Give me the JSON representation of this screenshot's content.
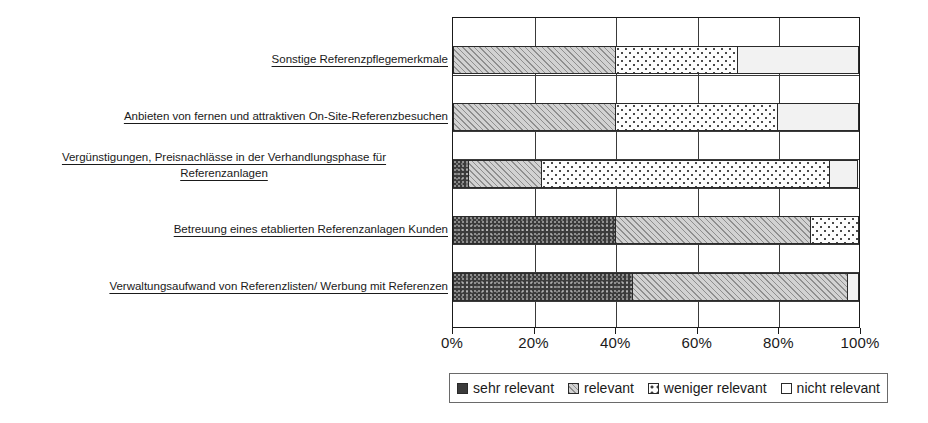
{
  "chart_data": {
    "type": "bar",
    "orientation": "horizontal",
    "stacked": true,
    "stack_mode": "percent",
    "title": "",
    "xlabel": "",
    "ylabel": "",
    "xlim": [
      0,
      100
    ],
    "xticks": [
      "0%",
      "20%",
      "40%",
      "60%",
      "80%",
      "100%"
    ],
    "xtick_values": [
      0,
      20,
      40,
      60,
      80,
      100
    ],
    "grid": true,
    "legend_position": "bottom",
    "categories": [
      "Verwaltungsaufwand von Referenzlisten/ Werbung mit Referenzen",
      "Betreuung eines etablierten Referenzanlagen Kunden",
      "Vergünstigungen, Preisnachlässe in der Verhandlungsphase für Referenzanlagen",
      "Anbieten von fernen und attraktiven On-Site-Referenzbesuchen",
      "Sonstige Referenzpflegemerkmale"
    ],
    "category_lines": [
      [
        "Verwaltungsaufwand von Referenzlisten/ Werbung mit Referenzen"
      ],
      [
        "Betreuung eines etablierten Referenzanlagen Kunden"
      ],
      [
        "Vergünstigungen, Preisnachlässe in der Verhandlungsphase für",
        "Referenzanlagen"
      ],
      [
        "Anbieten von fernen und attraktiven On-Site-Referenzbesuchen"
      ],
      [
        "Sonstige Referenzpflegemerkmale"
      ]
    ],
    "series": [
      {
        "name": "sehr relevant",
        "pattern": "solid-dark",
        "values": [
          44,
          40,
          4,
          0,
          0
        ]
      },
      {
        "name": "relevant",
        "pattern": "diagonal-hatch",
        "values": [
          53,
          48,
          18,
          40,
          40
        ]
      },
      {
        "name": "weniger relevant",
        "pattern": "dotted",
        "values": [
          0,
          12,
          71,
          40,
          30
        ]
      },
      {
        "name": "nicht relevant",
        "pattern": "white",
        "values": [
          3,
          0,
          7,
          20,
          30
        ]
      }
    ]
  },
  "legend": {
    "items": [
      {
        "label": "sehr relevant"
      },
      {
        "label": "relevant"
      },
      {
        "label": "weniger relevant"
      },
      {
        "label": "nicht relevant"
      }
    ]
  },
  "colors": {
    "sehr_relevant": "#3b3b3b",
    "relevant": "#d2d2d2",
    "weniger_relevant": "#fdfdfd",
    "nicht_relevant": "#f2f2f2",
    "axis": "#1a1a1a",
    "grid": "#3a3a3a"
  }
}
